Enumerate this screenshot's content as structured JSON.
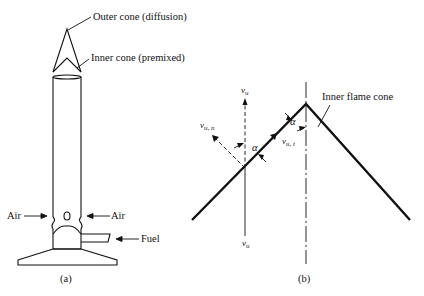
{
  "panel_a": {
    "caption": "(a)",
    "labels": {
      "outer_cone": "Outer cone (diffusion)",
      "inner_cone": "Inner cone (premixed)",
      "air_left": "Air",
      "air_right": "Air",
      "fuel": "Fuel"
    }
  },
  "panel_b": {
    "caption": "(b)",
    "labels": {
      "inner_flame_cone": "Inner flame cone",
      "vu_top": "v",
      "vu_top_sub": "u",
      "vu_bottom": "v",
      "vu_bottom_sub": "u",
      "vun": "v",
      "vun_sub": "u, n",
      "vut": "v",
      "vut_sub": "u, t",
      "alpha_left": "α",
      "alpha_right": "α"
    }
  },
  "colors": {
    "ink": "#111111",
    "background": "#ffffff"
  }
}
